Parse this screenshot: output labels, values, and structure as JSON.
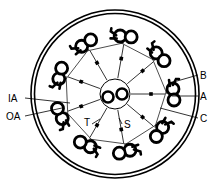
{
  "diagram": {
    "type": "axoneme-cross-section",
    "structure": "9+2",
    "center": [
      115,
      94
    ],
    "membrane": {
      "outer_radius": 84,
      "inner_radius": 80.5
    },
    "doublet_ring_radius": 58,
    "doublet_count": 9,
    "central_pair": {
      "sheath_radius": 15,
      "tubule_radius": 5.5,
      "offsets": [
        -7,
        7
      ]
    },
    "colors": {
      "ink": "#000000",
      "background": "#ffffff"
    }
  },
  "labels": {
    "B": "B",
    "A": "A",
    "C": "C",
    "IA": "IA",
    "OA": "OA",
    "T": "T",
    "S": "S"
  }
}
